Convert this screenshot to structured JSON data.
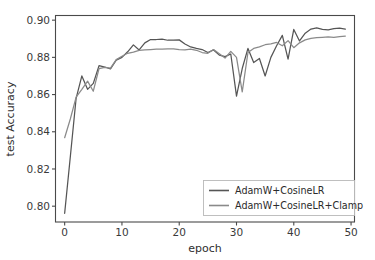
{
  "chart_data": {
    "type": "line",
    "title": "",
    "xlabel": "epoch",
    "ylabel": "test Accuracy",
    "xlim": [
      -1.6,
      50.6
    ],
    "ylim": [
      0.7915,
      0.9025
    ],
    "xticks": [
      0,
      10,
      20,
      30,
      40,
      50
    ],
    "xtick_labels": [
      "0",
      "10",
      "20",
      "30",
      "40",
      "50"
    ],
    "yticks": [
      0.8,
      0.82,
      0.84,
      0.86,
      0.88,
      0.9
    ],
    "ytick_labels": [
      "0.80",
      "0.82",
      "0.84",
      "0.86",
      "0.88",
      "0.90"
    ],
    "grid": false,
    "legend_position": "lower right",
    "x": [
      0,
      1,
      2,
      3,
      4,
      5,
      6,
      7,
      8,
      9,
      10,
      11,
      12,
      13,
      14,
      15,
      16,
      17,
      18,
      19,
      20,
      21,
      22,
      23,
      24,
      25,
      26,
      27,
      28,
      29,
      30,
      31,
      32,
      33,
      34,
      35,
      36,
      37,
      38,
      39,
      40,
      41,
      42,
      43,
      44,
      45,
      46,
      47,
      48,
      49
    ],
    "series": [
      {
        "name": "AdamW+CosineLR",
        "color": "#555555",
        "values": [
          0.7962,
          0.827,
          0.858,
          0.87,
          0.8628,
          0.866,
          0.8755,
          0.8748,
          0.8738,
          0.8785,
          0.88,
          0.883,
          0.8867,
          0.884,
          0.8878,
          0.8896,
          0.8896,
          0.8898,
          0.8892,
          0.8893,
          0.8894,
          0.8872,
          0.8856,
          0.8848,
          0.8842,
          0.8826,
          0.884,
          0.8812,
          0.8804,
          0.8818,
          0.8592,
          0.874,
          0.8848,
          0.8772,
          0.8794,
          0.87,
          0.88,
          0.8862,
          0.8918,
          0.879,
          0.895,
          0.8888,
          0.893,
          0.8952,
          0.8958,
          0.895,
          0.8948,
          0.8955,
          0.8957,
          0.8952
        ]
      },
      {
        "name": "AdamW+CosineLR+Clamp",
        "color": "#8a8a8a",
        "values": [
          0.8368,
          0.847,
          0.8586,
          0.8628,
          0.8672,
          0.8618,
          0.874,
          0.8746,
          0.8742,
          0.8788,
          0.8806,
          0.8822,
          0.8828,
          0.8838,
          0.884,
          0.8842,
          0.8844,
          0.8844,
          0.8845,
          0.8846,
          0.8842,
          0.884,
          0.8844,
          0.8838,
          0.8826,
          0.8822,
          0.8842,
          0.882,
          0.8796,
          0.8832,
          0.88,
          0.8614,
          0.8826,
          0.8848,
          0.8856,
          0.8868,
          0.8872,
          0.888,
          0.8862,
          0.889,
          0.8852,
          0.8878,
          0.8894,
          0.8902,
          0.8906,
          0.8908,
          0.891,
          0.8908,
          0.8912,
          0.8914
        ]
      }
    ]
  },
  "legend": {
    "entries": [
      {
        "label": "AdamW+CosineLR"
      },
      {
        "label": "AdamW+CosineLR+Clamp"
      }
    ]
  }
}
